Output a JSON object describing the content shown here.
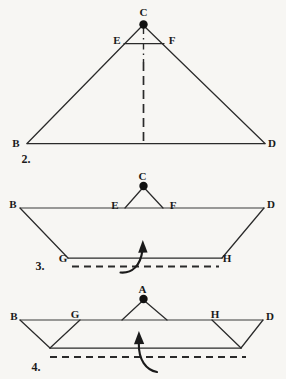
{
  "figure": {
    "background_color": "#f7f6f3",
    "ink_color": "#2a2a2a",
    "steps": [
      {
        "number": "2.",
        "description": "large triangle with apex C, midline EF and vertical dash-dot crease",
        "vertices": [
          "B",
          "C",
          "D",
          "E",
          "F"
        ]
      },
      {
        "number": "3.",
        "description": "trapezoid with small triangle C on top edge between E and F, fold line GH below",
        "vertices": [
          "B",
          "C",
          "D",
          "E",
          "F",
          "G",
          "H"
        ]
      },
      {
        "number": "4.",
        "description": "flattened band with small triangle A at center, corner flaps at G and H, bottom fold dashed line",
        "vertices": [
          "A",
          "B",
          "D",
          "G",
          "H"
        ]
      }
    ]
  },
  "step2": {
    "label": "2.",
    "points": {
      "B": "B",
      "C": "C",
      "D": "D",
      "E": "E",
      "F": "F"
    }
  },
  "step3": {
    "label": "3.",
    "points": {
      "B": "B",
      "C": "C",
      "D": "D",
      "E": "E",
      "F": "F",
      "G": "G",
      "H": "H"
    },
    "arrow": "fold-up-arrow"
  },
  "step4": {
    "label": "4.",
    "points": {
      "A": "A",
      "B": "B",
      "D": "D",
      "G": "G",
      "H": "H"
    },
    "arrow": "fold-up-arrow"
  }
}
